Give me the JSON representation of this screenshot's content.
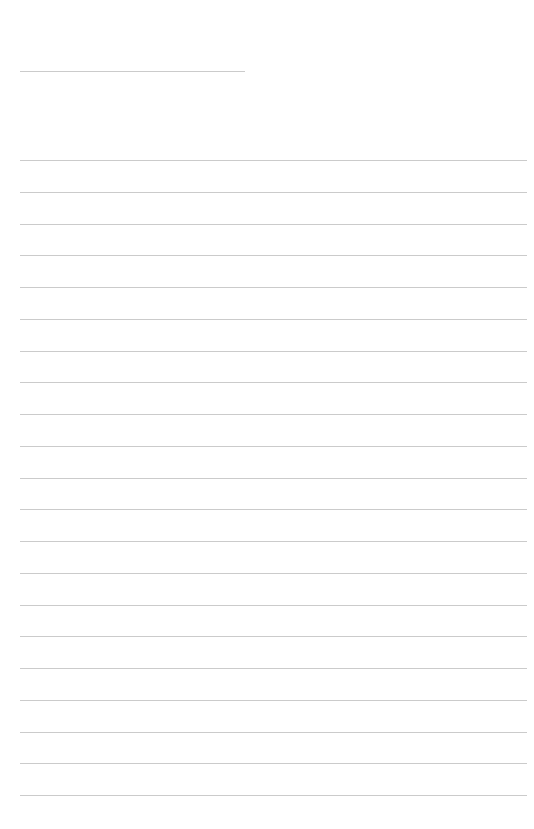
{
  "page": {
    "type": "lined-paper",
    "background": "#ffffff",
    "line_color": "#cbcbcb",
    "header_line": {
      "x": 20,
      "y": 71,
      "width": 225
    },
    "ruled_lines": {
      "count": 21,
      "x": 20,
      "width": 507,
      "first_y": 160,
      "spacing": 31.75
    }
  }
}
